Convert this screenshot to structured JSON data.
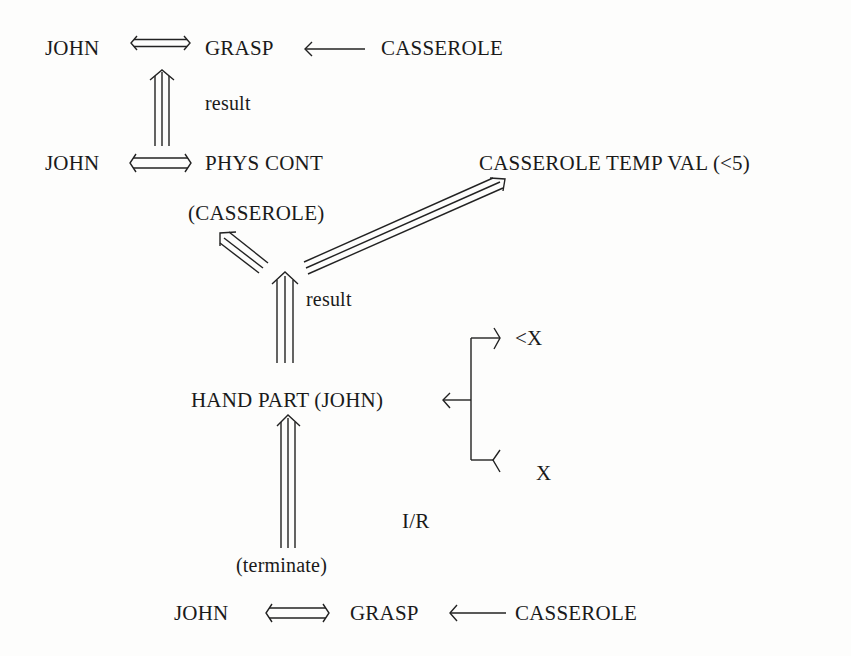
{
  "diagram": {
    "type": "conceptual-dependency",
    "top": {
      "actor": "JOHN",
      "act": "GRASP",
      "object": "CASSEROLE",
      "link_actor_act": "two-way",
      "link_object": "object"
    },
    "result_label_1": "result",
    "middle": {
      "actor": "JOHN",
      "state": "PHYS CONT",
      "state_right": "CASSEROLE TEMP VAL (<5)",
      "object": "(CASSEROLE)"
    },
    "result_label_2": "result",
    "hand": {
      "label": "HAND PART (JOHN)",
      "branch_upper": "<X",
      "branch_lower": "X"
    },
    "ir_label": "I/R",
    "terminate_label": "(terminate)",
    "bottom": {
      "actor": "JOHN",
      "act": "GRASP",
      "object": "CASSEROLE"
    },
    "colors": {
      "ink": "#222222",
      "paper": "#fdfdfc"
    }
  }
}
